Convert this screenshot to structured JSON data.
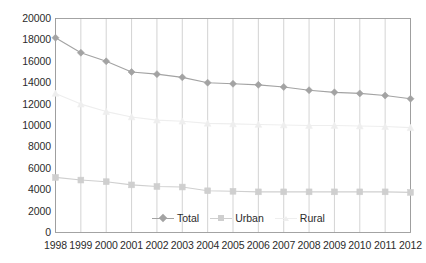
{
  "chart_data": {
    "type": "line",
    "title": "",
    "xlabel": "",
    "ylabel": "",
    "grid": "vertical",
    "legend_position": "inside-bottom-center",
    "ylim": [
      0,
      20000
    ],
    "ytick_step": 2000,
    "ytick_labels": [
      "20000",
      "18000",
      "16000",
      "14000",
      "12000",
      "10000",
      "8000",
      "6000",
      "4000",
      "2000",
      "0"
    ],
    "ytick_values": [
      20000,
      18000,
      16000,
      14000,
      12000,
      10000,
      8000,
      6000,
      4000,
      2000,
      0
    ],
    "categories": [
      "1998",
      "1999",
      "2000",
      "2001",
      "2002",
      "2003",
      "2004",
      "2005",
      "2006",
      "2007",
      "2008",
      "2009",
      "2010",
      "2011",
      "2012"
    ],
    "series": [
      {
        "name": "Total",
        "color": "#a3a3a3",
        "marker": "diamond",
        "values": [
          18200,
          16800,
          16000,
          15000,
          14800,
          14500,
          14000,
          13900,
          13800,
          13600,
          13300,
          13100,
          13000,
          12800,
          12500
        ]
      },
      {
        "name": "Urban",
        "color": "#cfcfcf",
        "marker": "square",
        "values": [
          5150,
          4900,
          4750,
          4450,
          4300,
          4250,
          3900,
          3850,
          3800,
          3800,
          3800,
          3800,
          3800,
          3800,
          3750
        ]
      },
      {
        "name": "Rural",
        "color": "#eeeeee",
        "marker": "triangle",
        "values": [
          13000,
          12000,
          11300,
          10800,
          10500,
          10400,
          10200,
          10150,
          10100,
          10050,
          10000,
          10000,
          9950,
          9900,
          9800
        ]
      }
    ]
  },
  "legend": {
    "items": [
      {
        "label": "Total"
      },
      {
        "label": "Urban"
      },
      {
        "label": "Rural"
      }
    ]
  },
  "colors": {
    "axis": "#9a9a9a",
    "grid": "#c8c8c8",
    "text": "#2b2b2b",
    "total": "#a3a3a3",
    "urban": "#cfcfcf",
    "rural": "#eeeeee",
    "background": "#ffffff"
  }
}
